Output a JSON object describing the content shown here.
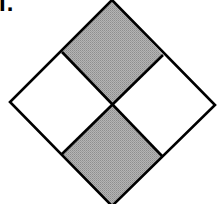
{
  "figure": {
    "label": "I.",
    "shaded_color": "#a8a8a8",
    "unshaded_color": "#ffffff",
    "line_color": "#000000",
    "quadrants": [
      {
        "position": "top",
        "shaded": true
      },
      {
        "position": "left",
        "shaded": false
      },
      {
        "position": "right",
        "shaded": false
      },
      {
        "position": "bottom",
        "shaded": true
      }
    ]
  }
}
